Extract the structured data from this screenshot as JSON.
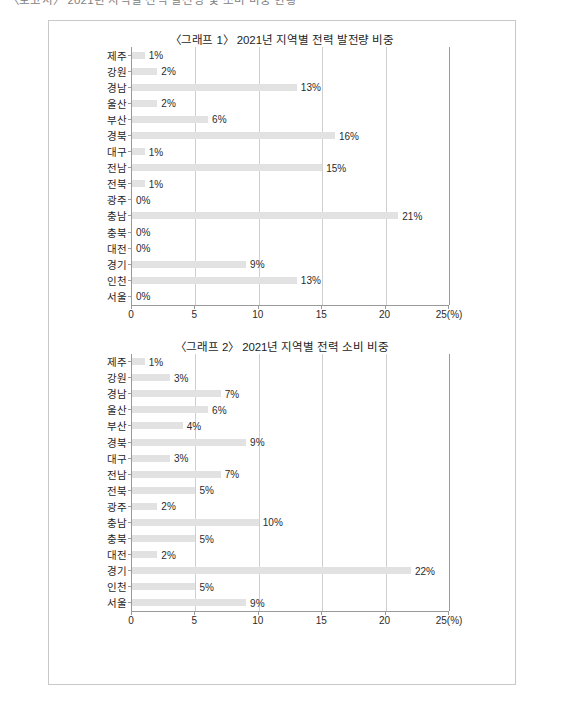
{
  "page": {
    "clipped_heading": "〈보고서〉 2021년 지역별 전력 발전량 및 소비 비중 현황"
  },
  "chart_data": [
    {
      "id": "chart1",
      "type": "bar",
      "orientation": "horizontal",
      "title": "〈그래프 1〉 2021년 지역별 전력 발전량 비중",
      "xlabel": "",
      "ylabel": "",
      "unit": "(%)",
      "xlim": [
        0,
        25
      ],
      "xticks": [
        0,
        5,
        10,
        15,
        20,
        25
      ],
      "xticklabels": [
        "0",
        "5",
        "10",
        "15",
        "20",
        "25(%)"
      ],
      "grid": true,
      "legend": "none",
      "bar_color": "#e2e2e2",
      "categories": [
        "제주",
        "강원",
        "경남",
        "울산",
        "부산",
        "경북",
        "대구",
        "전남",
        "전북",
        "광주",
        "충남",
        "충북",
        "대전",
        "경기",
        "인천",
        "서울"
      ],
      "values": [
        1,
        2,
        13,
        2,
        6,
        16,
        1,
        15,
        1,
        0,
        21,
        0,
        0,
        9,
        13,
        0
      ],
      "labels": [
        "1%",
        "2%",
        "13%",
        "2%",
        "6%",
        "16%",
        "1%",
        "15%",
        "1%",
        "0%",
        "21%",
        "0%",
        "0%",
        "9%",
        "13%",
        "0%"
      ]
    },
    {
      "id": "chart2",
      "type": "bar",
      "orientation": "horizontal",
      "title": "〈그래프 2〉 2021년 지역별 전력 소비 비중",
      "xlabel": "",
      "ylabel": "",
      "unit": "(%)",
      "xlim": [
        0,
        25
      ],
      "xticks": [
        0,
        5,
        10,
        15,
        20,
        25
      ],
      "xticklabels": [
        "0",
        "5",
        "10",
        "15",
        "20",
        "25(%)"
      ],
      "grid": true,
      "legend": "none",
      "bar_color": "#e2e2e2",
      "categories": [
        "제주",
        "강원",
        "경남",
        "울산",
        "부산",
        "경북",
        "대구",
        "전남",
        "전북",
        "광주",
        "충남",
        "충북",
        "대전",
        "경기",
        "인천",
        "서울"
      ],
      "values": [
        1,
        3,
        7,
        6,
        4,
        9,
        3,
        7,
        5,
        2,
        10,
        5,
        2,
        22,
        5,
        9
      ],
      "labels": [
        "1%",
        "3%",
        "7%",
        "6%",
        "4%",
        "9%",
        "3%",
        "7%",
        "5%",
        "2%",
        "10%",
        "5%",
        "2%",
        "22%",
        "5%",
        "9%"
      ]
    }
  ]
}
